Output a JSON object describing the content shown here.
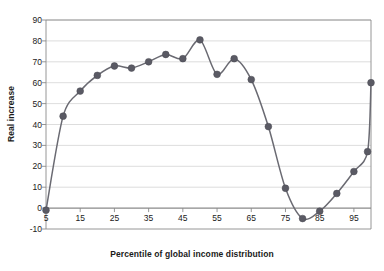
{
  "chart_data": {
    "type": "line",
    "title": "",
    "xlabel": "Percentile of global income distribution",
    "ylabel": "Real increase",
    "xlim": [
      5,
      100
    ],
    "ylim": [
      -10,
      90
    ],
    "xticks": [
      5,
      15,
      25,
      35,
      45,
      55,
      65,
      75,
      85,
      95
    ],
    "xtick_labels": [
      "5",
      "15",
      "25",
      "35",
      "45",
      "55",
      "65",
      "75",
      "85",
      "95"
    ],
    "yticks": [
      -10,
      0,
      10,
      20,
      30,
      40,
      50,
      60,
      70,
      80,
      90
    ],
    "ytick_labels": [
      "-10",
      "0",
      "10",
      "20",
      "30",
      "40",
      "50",
      "60",
      "70",
      "80",
      "90"
    ],
    "grid": "horizontal",
    "legend": "none",
    "marker": "circle",
    "series_color": "#5a5a64",
    "line_color": "#6a6a72",
    "grid_color": "#d4d4d4",
    "axis_color": "#8a8a8a",
    "plot_background": "#ffffff",
    "x": [
      5,
      10,
      15,
      20,
      25,
      30,
      35,
      40,
      45,
      50,
      55,
      60,
      65,
      70,
      75,
      80,
      85,
      90,
      95,
      100
    ],
    "values": [
      -1,
      44,
      56,
      63.5,
      68,
      67,
      70,
      73.5,
      71.5,
      80.5,
      64,
      71.5,
      61.5,
      39,
      9.5,
      -5,
      -1.5,
      7,
      17.5,
      27
    ],
    "extra_point": {
      "x": 100,
      "y": 60
    },
    "series": [
      {
        "name": "Real income increase by global income percentile",
        "points": [
          {
            "x": 5,
            "y": -1
          },
          {
            "x": 10,
            "y": 44
          },
          {
            "x": 15,
            "y": 56
          },
          {
            "x": 20,
            "y": 63.5
          },
          {
            "x": 25,
            "y": 68
          },
          {
            "x": 30,
            "y": 67
          },
          {
            "x": 35,
            "y": 70
          },
          {
            "x": 40,
            "y": 73.5
          },
          {
            "x": 45,
            "y": 71.5
          },
          {
            "x": 50,
            "y": 80.5
          },
          {
            "x": 55,
            "y": 64
          },
          {
            "x": 60,
            "y": 71.5
          },
          {
            "x": 65,
            "y": 61.5
          },
          {
            "x": 70,
            "y": 39
          },
          {
            "x": 75,
            "y": 9.5
          },
          {
            "x": 80,
            "y": -5
          },
          {
            "x": 85,
            "y": -1.5
          },
          {
            "x": 90,
            "y": 7
          },
          {
            "x": 95,
            "y": 17.5
          },
          {
            "x": 99,
            "y": 27
          },
          {
            "x": 100,
            "y": 60
          }
        ]
      }
    ]
  }
}
